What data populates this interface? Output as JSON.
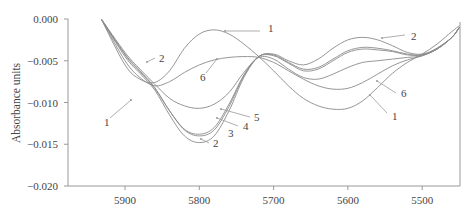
{
  "chart_data": {
    "type": "line",
    "title": "",
    "xlabel": "",
    "ylabel": "Absorbance units",
    "xlim": [
      5977,
      5450
    ],
    "ylim": [
      -0.02,
      0.0
    ],
    "x_reversed": true,
    "grid": false,
    "legend": "none (curves labeled inline with leader arrows)",
    "x_ticks": [
      5900,
      5800,
      5700,
      5600,
      5500
    ],
    "x_tick_labels": [
      "5900",
      "5800",
      "5700",
      "5600",
      "5500"
    ],
    "y_ticks": [
      0.0,
      -0.005,
      -0.01,
      -0.015,
      -0.02
    ],
    "y_tick_labels": [
      "0.000",
      "-0.005",
      "-0.010",
      "-0.015",
      "-0.020"
    ],
    "x": [
      5932,
      5900,
      5880,
      5860,
      5840,
      5820,
      5800,
      5780,
      5760,
      5740,
      5720,
      5700,
      5680,
      5660,
      5640,
      5620,
      5600,
      5580,
      5560,
      5540,
      5520,
      5500,
      5480,
      5460,
      5450
    ],
    "series": [
      {
        "name": "1",
        "values": [
          0.0,
          -0.0055,
          -0.0072,
          -0.0076,
          -0.0062,
          -0.0035,
          -0.0018,
          -0.0013,
          -0.0018,
          -0.003,
          -0.0045,
          -0.0062,
          -0.008,
          -0.0095,
          -0.0104,
          -0.0108,
          -0.0107,
          -0.0098,
          -0.0082,
          -0.0065,
          -0.0052,
          -0.0042,
          -0.003,
          -0.0015,
          -0.0008
        ]
      },
      {
        "name": "2",
        "values": [
          0.0,
          -0.0045,
          -0.0065,
          -0.0085,
          -0.0115,
          -0.014,
          -0.0148,
          -0.014,
          -0.011,
          -0.007,
          -0.0045,
          -0.0042,
          -0.005,
          -0.0055,
          -0.0048,
          -0.0035,
          -0.0025,
          -0.0022,
          -0.0025,
          -0.0032,
          -0.004,
          -0.0042,
          -0.0035,
          -0.0022,
          -0.001
        ]
      },
      {
        "name": "3",
        "values": [
          0.0,
          -0.0042,
          -0.0062,
          -0.0082,
          -0.011,
          -0.0133,
          -0.014,
          -0.0133,
          -0.0105,
          -0.0068,
          -0.0045,
          -0.0043,
          -0.0052,
          -0.006,
          -0.0058,
          -0.0048,
          -0.0038,
          -0.0034,
          -0.0035,
          -0.0038,
          -0.0042,
          -0.0043,
          -0.0036,
          -0.0022,
          -0.001
        ]
      },
      {
        "name": "4",
        "values": [
          0.0,
          -0.0043,
          -0.0063,
          -0.0083,
          -0.011,
          -0.0132,
          -0.0138,
          -0.013,
          -0.0102,
          -0.0067,
          -0.0045,
          -0.0044,
          -0.0053,
          -0.0062,
          -0.006,
          -0.005,
          -0.004,
          -0.0036,
          -0.0037,
          -0.0039,
          -0.0043,
          -0.0043,
          -0.0036,
          -0.0022,
          -0.001
        ]
      },
      {
        "name": "5",
        "values": [
          0.0,
          -0.004,
          -0.006,
          -0.0078,
          -0.0095,
          -0.0104,
          -0.0107,
          -0.0102,
          -0.0088,
          -0.0064,
          -0.0046,
          -0.0048,
          -0.006,
          -0.007,
          -0.0072,
          -0.0066,
          -0.0058,
          -0.0052,
          -0.005,
          -0.0048,
          -0.0046,
          -0.0044,
          -0.0036,
          -0.0022,
          -0.001
        ]
      },
      {
        "name": "6",
        "values": [
          0.0,
          -0.005,
          -0.007,
          -0.008,
          -0.0075,
          -0.0064,
          -0.0055,
          -0.0049,
          -0.0046,
          -0.0045,
          -0.0046,
          -0.0052,
          -0.0062,
          -0.0072,
          -0.008,
          -0.0084,
          -0.0083,
          -0.0076,
          -0.0066,
          -0.0056,
          -0.0049,
          -0.0044,
          -0.0035,
          -0.0022,
          -0.001
        ]
      }
    ],
    "annotations": [
      {
        "text": "1",
        "target": "max of curve 1 near 5780",
        "label_pos": [
          5720,
          -0.0012
        ]
      },
      {
        "text": "1",
        "target": "first min of curve 1 near 5860",
        "label_pos": [
          5935,
          -0.0114
        ]
      },
      {
        "text": "1",
        "target": "second min of curve 1 near 5570",
        "label_pos": [
          5535,
          -0.0114
        ]
      },
      {
        "text": "2",
        "target": "curve 2 near 5865",
        "label_pos": [
          5845,
          -0.005
        ]
      },
      {
        "text": "2",
        "target": "curve 2 local max near 5590",
        "label_pos": [
          5520,
          -0.0016
        ]
      },
      {
        "text": "2",
        "target": "curve 2 min near 5800",
        "label_pos": [
          5790,
          -0.0154
        ]
      },
      {
        "text": "3",
        "target": "curve 3 near 5760",
        "label_pos": [
          5765,
          -0.0145
        ]
      },
      {
        "text": "4",
        "target": "curve 4 near 5770",
        "label_pos": [
          5745,
          -0.0137
        ]
      },
      {
        "text": "5",
        "target": "curve 5 near 5760",
        "label_pos": [
          5720,
          -0.0122
        ]
      },
      {
        "text": "6",
        "target": "curve 6 near 5780",
        "label_pos": [
          5820,
          -0.0075
        ]
      },
      {
        "text": "6",
        "target": "curve 6 near 5580",
        "label_pos": [
          5535,
          -0.0092
        ]
      }
    ]
  },
  "labels": {
    "y_axis_title": "Absorbance units",
    "x_ticks": [
      "5900",
      "5800",
      "5700",
      "5600",
      "5500"
    ],
    "y_ticks": [
      "0.000",
      "-0.005",
      "-0.010",
      "-0.015",
      "-0.020"
    ]
  }
}
